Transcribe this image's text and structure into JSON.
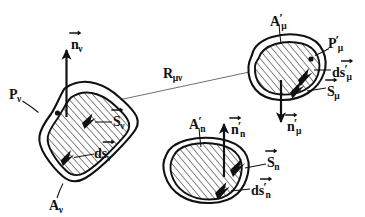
{
  "figure": {
    "background_color": "#ffffff",
    "ink_color": "#111111",
    "hatch_color": "#1a1a1a",
    "thin_line_color": "#555555"
  },
  "labels": {
    "n_nu": {
      "base": "n",
      "sub": "ν",
      "prime": "",
      "vector": true
    },
    "P_nu": {
      "base": "P",
      "sub": "ν",
      "prime": "",
      "vector": false
    },
    "S_nu": {
      "base": "S",
      "sub": "ν",
      "prime": "",
      "vector": true
    },
    "ds_nu": {
      "base": "ds",
      "sub": "ν",
      "prime": "",
      "vector": true
    },
    "A_nu": {
      "base": "A",
      "sub": "ν",
      "prime": "",
      "vector": false
    },
    "R_munu": {
      "base": "R",
      "sub": "μν",
      "prime": "",
      "vector": false
    },
    "A_mu_prime": {
      "base": "A",
      "sub": "μ",
      "prime": "′",
      "vector": false
    },
    "P_mu_prime": {
      "base": "P",
      "sub": "μ",
      "prime": "′",
      "vector": false
    },
    "ds_mu_prime": {
      "base": "ds",
      "sub": "μ",
      "prime": "′",
      "vector": true
    },
    "S_mu": {
      "base": "S",
      "sub": "μ",
      "prime": "",
      "vector": true
    },
    "n_mu_prime": {
      "base": "n",
      "sub": "μ",
      "prime": "′",
      "vector": true
    },
    "A_n_prime": {
      "base": "A",
      "sub": "n",
      "prime": "′",
      "vector": false
    },
    "n_n_prime": {
      "base": "n",
      "sub": "n",
      "prime": "′",
      "vector": true
    },
    "S_n": {
      "base": "S",
      "sub": "n",
      "prime": "",
      "vector": true
    },
    "ds_n_prime": {
      "base": "ds",
      "sub": "n",
      "prime": "′",
      "vector": true
    }
  },
  "shapes": {
    "loop_nu": {
      "name": "loop-nu",
      "center": [
        116,
        159
      ],
      "label": "A_nu"
    },
    "loop_mu": {
      "name": "loop-mu-prime",
      "center": [
        290,
        68
      ],
      "label": "A_mu_prime"
    },
    "loop_n": {
      "name": "loop-n-prime",
      "center": [
        213,
        172
      ],
      "label": "A_n_prime"
    }
  },
  "connector": {
    "name": "separation-vector-R",
    "from": [
      57,
      113
    ],
    "to": [
      310,
      59
    ],
    "label": "R_munu"
  }
}
